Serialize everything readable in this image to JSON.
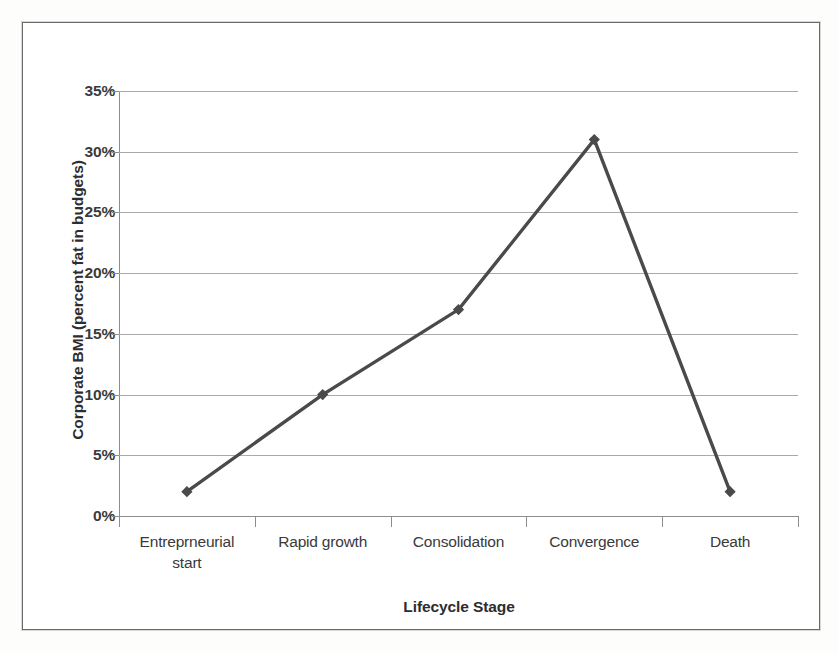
{
  "chart_data": {
    "type": "line",
    "title": "",
    "categories": [
      "Entreprneurial start",
      "Rapid growth",
      "Consolidation",
      "Convergence",
      "Death"
    ],
    "category_lines": [
      [
        "Entreprneurial",
        "start"
      ],
      [
        "Rapid growth"
      ],
      [
        "Consolidation"
      ],
      [
        "Convergence"
      ],
      [
        "Death"
      ]
    ],
    "values": [
      2,
      10,
      17,
      31,
      2
    ],
    "value_labels": [
      "2%",
      "10%",
      "17%",
      "31%",
      "2%"
    ],
    "xlabel": "Lifecycle Stage",
    "ylabel": "Corporate BMI (percent fat in budgets)",
    "ylim": [
      0,
      35
    ],
    "ytick_values": [
      0,
      5,
      10,
      15,
      20,
      25,
      30,
      35
    ],
    "ytick_labels": [
      "0%",
      "5%",
      "10%",
      "15%",
      "20%",
      "25%",
      "30%",
      "35%"
    ],
    "grid": true,
    "grid_axis": "y",
    "legend": false,
    "legend_position": "none",
    "marker": "diamond",
    "series_color": "#4a4a4a",
    "grid_color": "#aaaaaa",
    "axis_color": "#8d8d8d",
    "frame_color": "#6a6a6a",
    "background_color": "#ffffff"
  }
}
